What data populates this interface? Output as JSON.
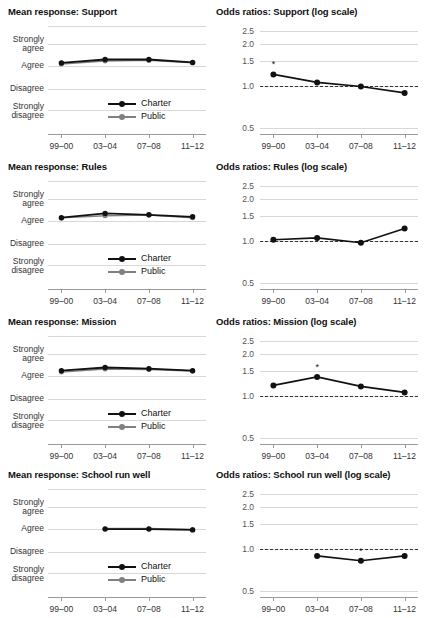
{
  "figure": {
    "legend": {
      "charter_label": "Charter",
      "public_label": "Public",
      "charter_color": "#111111",
      "public_color": "#808080"
    },
    "x_categories": [
      "99–00",
      "03–04",
      "07–08",
      "11–12"
    ],
    "mean_y_labels": [
      "Strongly\nagree",
      "Agree",
      "Disagree",
      "Strongly\ndisagree"
    ],
    "mean_y_labels_flat": [
      "Strongly agree",
      "Agree",
      "Disagree",
      "Strongly disagree"
    ],
    "odds_y_labels": [
      "2.5",
      "2.0",
      "1.5",
      "1.0",
      "0.5"
    ],
    "significance_marker": "*",
    "reference_line_value": "1.0"
  },
  "panels": [
    {
      "id": "support",
      "mean_title": "Mean response: Support",
      "odds_title": "Odds ratios: Support (log scale)"
    },
    {
      "id": "rules",
      "mean_title": "Mean response: Rules",
      "odds_title": "Odds ratios: Rules (log scale)"
    },
    {
      "id": "mission",
      "mean_title": "Mean response: Mission",
      "odds_title": "Odds ratios: Mission (log scale)"
    },
    {
      "id": "school_run_well",
      "mean_title": "Mean response: School run well",
      "odds_title": "Odds ratios: School run well (log scale)"
    }
  ],
  "chart_data": [
    {
      "type": "line",
      "id": "mean-support",
      "title": "Mean response: Support",
      "xlabel": "",
      "ylabel": "",
      "x": [
        "99–00",
        "03–04",
        "07–08",
        "11–12"
      ],
      "ytick_labels": [
        "Strongly agree",
        "Agree",
        "Disagree",
        "Strongly disagree"
      ],
      "ytick_values": [
        4,
        3,
        2,
        1
      ],
      "ylim": [
        0.6,
        4.4
      ],
      "grid": true,
      "legend": "inside-lower-right",
      "series": [
        {
          "name": "Charter",
          "color": "#111111",
          "values": [
            3.1,
            3.22,
            3.22,
            3.12
          ]
        },
        {
          "name": "Public",
          "color": "#808080",
          "values": [
            3.06,
            3.17,
            3.19,
            3.1
          ]
        }
      ]
    },
    {
      "type": "line",
      "id": "odds-support",
      "title": "Odds ratios: Support (log scale)",
      "xlabel": "",
      "ylabel": "",
      "x": [
        "99–00",
        "03–04",
        "07–08",
        "11–12"
      ],
      "ytick_labels": [
        "0.5",
        "1.0",
        "1.5",
        "2.0",
        "2.5"
      ],
      "ytick_values": [
        0.5,
        1.0,
        1.5,
        2.0,
        2.5
      ],
      "ylim": [
        0.45,
        2.7
      ],
      "log_scale": true,
      "reference_line": 1.0,
      "grid": true,
      "series": [
        {
          "name": "Odds ratio",
          "color": "#111111",
          "values": [
            1.21,
            1.06,
            0.99,
            0.89
          ]
        }
      ],
      "annotations": [
        {
          "x": "99–00",
          "value": 1.21,
          "marker": "*"
        }
      ]
    },
    {
      "type": "line",
      "id": "mean-rules",
      "title": "Mean response: Rules",
      "xlabel": "",
      "ylabel": "",
      "x": [
        "99–00",
        "03–04",
        "07–08",
        "11–12"
      ],
      "ytick_labels": [
        "Strongly agree",
        "Agree",
        "Disagree",
        "Strongly disagree"
      ],
      "ytick_values": [
        4,
        3,
        2,
        1
      ],
      "ylim": [
        0.6,
        4.4
      ],
      "grid": true,
      "legend": "inside-lower-right",
      "series": [
        {
          "name": "Charter",
          "color": "#111111",
          "values": [
            3.11,
            3.26,
            3.21,
            3.14
          ]
        },
        {
          "name": "Public",
          "color": "#808080",
          "values": [
            3.1,
            3.18,
            3.2,
            3.11
          ]
        }
      ]
    },
    {
      "type": "line",
      "id": "odds-rules",
      "title": "Odds ratios: Rules (log scale)",
      "xlabel": "",
      "ylabel": "",
      "x": [
        "99–00",
        "03–04",
        "07–08",
        "11–12"
      ],
      "ytick_labels": [
        "0.5",
        "1.0",
        "1.5",
        "2.0",
        "2.5"
      ],
      "ytick_values": [
        0.5,
        1.0,
        1.5,
        2.0,
        2.5
      ],
      "ylim": [
        0.45,
        2.7
      ],
      "log_scale": true,
      "reference_line": 1.0,
      "grid": true,
      "series": [
        {
          "name": "Odds ratio",
          "color": "#111111",
          "values": [
            1.02,
            1.05,
            0.97,
            1.23
          ]
        }
      ],
      "annotations": []
    },
    {
      "type": "line",
      "id": "mean-mission",
      "title": "Mean response: Mission",
      "xlabel": "",
      "ylabel": "",
      "x": [
        "99–00",
        "03–04",
        "07–08",
        "11–12"
      ],
      "ytick_labels": [
        "Strongly agree",
        "Agree",
        "Disagree",
        "Strongly disagree"
      ],
      "ytick_values": [
        4,
        3,
        2,
        1
      ],
      "ylim": [
        0.6,
        4.4
      ],
      "grid": true,
      "legend": "inside-lower-right",
      "series": [
        {
          "name": "Charter",
          "color": "#111111",
          "values": [
            3.18,
            3.29,
            3.25,
            3.18
          ]
        },
        {
          "name": "Public",
          "color": "#808080",
          "values": [
            3.13,
            3.24,
            3.22,
            3.17
          ]
        }
      ]
    },
    {
      "type": "line",
      "id": "odds-mission",
      "title": "Odds ratios: Mission (log scale)",
      "xlabel": "",
      "ylabel": "",
      "x": [
        "99–00",
        "03–04",
        "07–08",
        "11–12"
      ],
      "ytick_labels": [
        "0.5",
        "1.0",
        "1.5",
        "2.0",
        "2.5"
      ],
      "ytick_values": [
        0.5,
        1.0,
        1.5,
        2.0,
        2.5
      ],
      "ylim": [
        0.45,
        2.7
      ],
      "log_scale": true,
      "reference_line": 1.0,
      "grid": true,
      "series": [
        {
          "name": "Odds ratio",
          "color": "#111111",
          "values": [
            1.19,
            1.37,
            1.17,
            1.06
          ]
        }
      ],
      "annotations": [
        {
          "x": "03–04",
          "value": 1.37,
          "marker": "*"
        }
      ]
    },
    {
      "type": "line",
      "id": "mean-school-run-well",
      "title": "Mean response: School run well",
      "xlabel": "",
      "ylabel": "",
      "x": [
        "99–00",
        "03–04",
        "07–08",
        "11–12"
      ],
      "ytick_labels": [
        "Strongly agree",
        "Agree",
        "Disagree",
        "Strongly disagree"
      ],
      "ytick_values": [
        4,
        3,
        2,
        1
      ],
      "ylim": [
        0.6,
        4.4
      ],
      "grid": true,
      "legend": "inside-lower-right",
      "series": [
        {
          "name": "Charter",
          "color": "#111111",
          "values": [
            null,
            2.99,
            2.99,
            2.96
          ]
        },
        {
          "name": "Public",
          "color": "#808080",
          "values": [
            null,
            3.01,
            3.01,
            2.98
          ]
        }
      ]
    },
    {
      "type": "line",
      "id": "odds-school-run-well",
      "title": "Odds ratios: School run well (log scale)",
      "xlabel": "",
      "ylabel": "",
      "x": [
        "99–00",
        "03–04",
        "07–08",
        "11–12"
      ],
      "ytick_labels": [
        "0.5",
        "1.0",
        "1.5",
        "2.0",
        "2.5"
      ],
      "ytick_values": [
        0.5,
        1.0,
        1.5,
        2.0,
        2.5
      ],
      "ylim": [
        0.45,
        2.7
      ],
      "log_scale": true,
      "reference_line": 1.0,
      "grid": true,
      "series": [
        {
          "name": "Odds ratio",
          "color": "#111111",
          "values": [
            null,
            0.89,
            0.82,
            0.89
          ]
        }
      ],
      "annotations": [
        {
          "x": "07–08",
          "value": 0.82,
          "marker": "*"
        }
      ]
    }
  ]
}
